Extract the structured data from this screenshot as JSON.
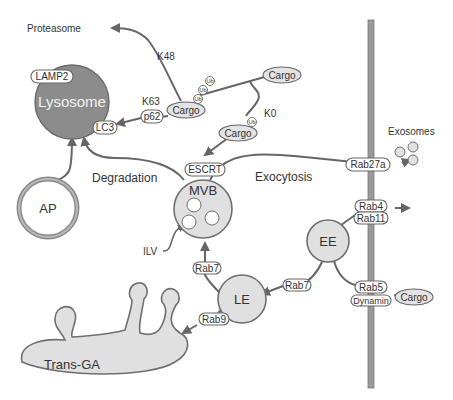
{
  "figure": {
    "colors": {
      "organelle_fill": "#e0e0e0",
      "lysosome_fill": "#8c8c8c",
      "line": "#666666",
      "membrane": "#9a9a9a",
      "text": "#333333"
    },
    "organelles": {
      "lysosome": "Lysosome",
      "ap": "AP",
      "mvb": "MVB",
      "le": "LE",
      "ee": "EE",
      "trans_ga": "Trans-GA"
    },
    "proteins": {
      "lamp2": "LAMP2",
      "lc3": "LC3",
      "p62": "p62",
      "escrt": "ESCRT",
      "rab27a": "Rab27a",
      "rab4": "Rab4",
      "rab11": "Rab11",
      "rab5": "Rab5",
      "dynamin": "Dynamin",
      "rab7_mvb": "Rab7",
      "rab7_ee": "Rab7",
      "rab9": "Rab9"
    },
    "cargo": {
      "cargo_k48": "Cargo",
      "cargo_surface": "Cargo",
      "cargo_k0": "Cargo",
      "cargo_endocytic": "Cargo",
      "ub": "Ub"
    },
    "labels": {
      "proteasome": "Proteasome",
      "k48": "K48",
      "k63": "K63",
      "k0": "K0",
      "degradation": "Degradation",
      "exocytosis": "Exocytosis",
      "exosomes": "Exosomes",
      "ilv": "ILV"
    },
    "pathways": [
      {
        "from": "Cargo (Ub chain)",
        "to": "Proteasome",
        "label": "K48"
      },
      {
        "from": "Cargo (Ub chain)",
        "to": "Lysosome (LC3)",
        "via": "p62",
        "label": "K63"
      },
      {
        "from": "Cargo (surface)",
        "to": "MVB (ESCRT)",
        "label": "K0"
      },
      {
        "from": "AP",
        "to": "Lysosome"
      },
      {
        "from": "MVB",
        "to": "Lysosome",
        "label": "Degradation"
      },
      {
        "from": "MVB",
        "to": "Exosomes",
        "via": "Rab27a",
        "label": "Exocytosis"
      },
      {
        "from": "LE",
        "to": "MVB",
        "via": "Rab7"
      },
      {
        "from": "EE",
        "to": "LE",
        "via": "Rab7"
      },
      {
        "from": "EE",
        "to": "Recycling",
        "via": "Rab4 / Rab11"
      },
      {
        "from": "Cargo",
        "to": "EE",
        "via": "Rab5 / Dynamin"
      },
      {
        "from": "LE",
        "to": "Trans-GA",
        "via": "Rab9",
        "bidirectional": true
      }
    ]
  }
}
